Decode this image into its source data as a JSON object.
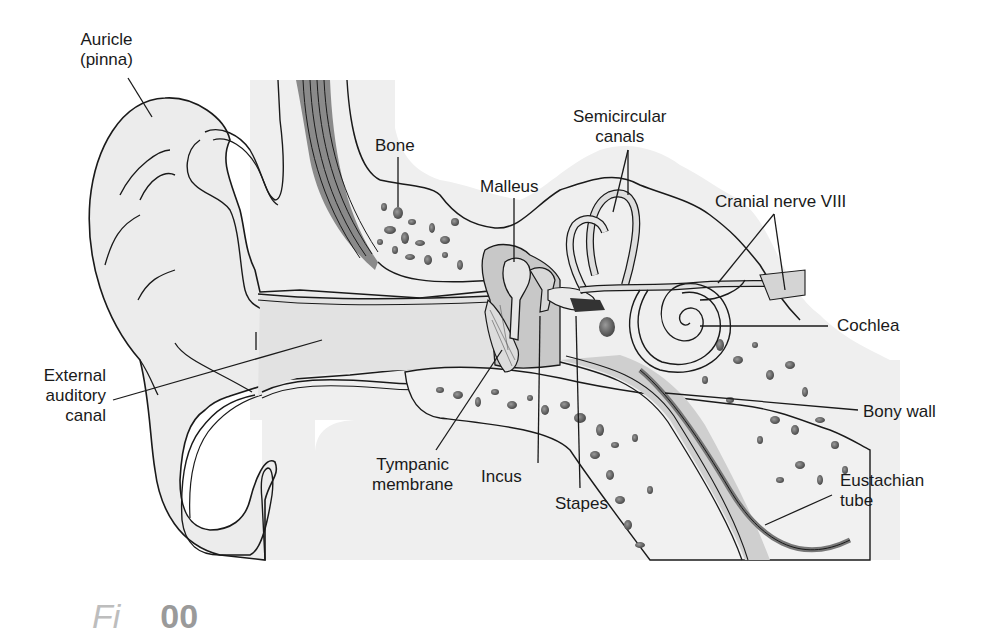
{
  "figure": {
    "caption_fragment": "Fi",
    "caption_number_fragment": "00"
  },
  "labels": {
    "auricle": [
      "Auricle",
      "(pinna)"
    ],
    "bone": "Bone",
    "malleus": "Malleus",
    "semicircular_canals": [
      "Semicircular",
      "canals"
    ],
    "cranial_nerve": "Cranial nerve VIII",
    "cochlea": "Cochlea",
    "external_canal": [
      "External",
      "auditory",
      "canal"
    ],
    "bony_wall": "Bony wall",
    "tympanic_membrane": [
      "Tympanic",
      "membrane"
    ],
    "incus": "Incus",
    "stapes": "Stapes",
    "eustachian_tube": [
      "Eustachian",
      "tube"
    ]
  },
  "colors": {
    "tissue_fill": "#ededed",
    "canal_fill": "#d6d6d6",
    "bone_spot": "#6a6a6a",
    "dark_band": "#8a8a8a",
    "outline": "#1a1a1a"
  }
}
